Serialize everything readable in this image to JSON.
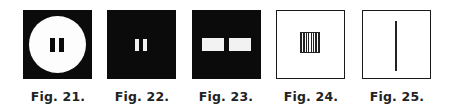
{
  "figures": [
    {
      "id": "fig-21",
      "caption": "Fig. 21.",
      "description": "black square with large white circle containing two short black vertical bars"
    },
    {
      "id": "fig-22",
      "caption": "Fig. 22.",
      "description": "black square with two short white vertical bars at center"
    },
    {
      "id": "fig-23",
      "caption": "Fig. 23.",
      "description": "black square with two white horizontal rectangles side by side"
    },
    {
      "id": "fig-24",
      "caption": "Fig. 24.",
      "description": "white square outline with small vertically striped square at center"
    },
    {
      "id": "fig-25",
      "caption": "Fig. 25.",
      "description": "white square outline with single thin vertical line at center"
    }
  ],
  "colors": {
    "ink": "#0b0b0b",
    "paper": "#ffffff"
  }
}
